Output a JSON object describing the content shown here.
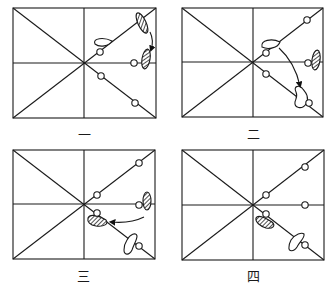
{
  "panels": [
    {
      "id": "panel-1",
      "label": "一",
      "frame": {
        "x": 13,
        "y": 8,
        "w": 143,
        "h": 110
      }
    },
    {
      "id": "panel-2",
      "label": "二",
      "frame": {
        "x": 182,
        "y": 8,
        "w": 141,
        "h": 109
      }
    },
    {
      "id": "panel-3",
      "label": "三",
      "frame": {
        "x": 13,
        "y": 150,
        "w": 142,
        "h": 109
      }
    },
    {
      "id": "panel-4",
      "label": "四",
      "frame": {
        "x": 182,
        "y": 150,
        "w": 142,
        "h": 110
      }
    }
  ],
  "colors": {
    "line": "#1a1a1a",
    "background": "#ffffff",
    "hatch": "#333333"
  }
}
